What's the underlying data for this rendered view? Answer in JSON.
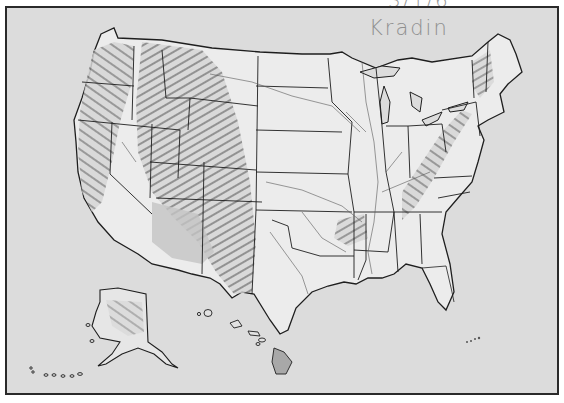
{
  "map": {
    "title": "United States physical relief outline map",
    "style": "grayscale shaded relief with state boundaries and rivers",
    "background_color": "#dcdcdc",
    "land_color": "#ececec",
    "border_color": "#2a2a2a",
    "regions": [
      {
        "name": "contiguous-us",
        "label": ""
      },
      {
        "name": "alaska",
        "label": ""
      },
      {
        "name": "hawaii",
        "label": ""
      }
    ],
    "relief_areas": [
      "Rocky Mountains",
      "Sierra Nevada",
      "Cascade Range",
      "Appalachian Mountains",
      "Ozark Plateau",
      "Alaska Range"
    ]
  },
  "annotations": {
    "handwriting_top": "3/1/6",
    "handwriting_name": "Kradin",
    "handwriting_color": "#8f8f8f"
  }
}
